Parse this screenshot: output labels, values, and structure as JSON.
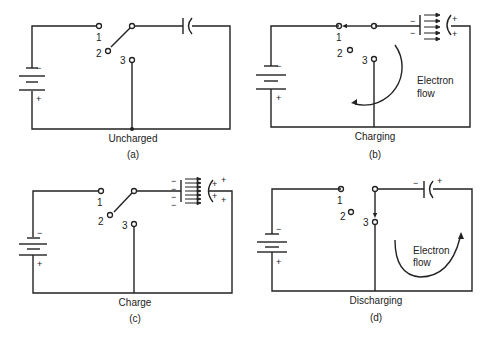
{
  "figure": {
    "panels": [
      {
        "id": "a",
        "state_label": "Uncharged",
        "panel_label": "(a)",
        "switch_position": "2",
        "flow_label": ""
      },
      {
        "id": "b",
        "state_label": "Charging",
        "panel_label": "(b)",
        "switch_position": "1",
        "flow_label_line1": "Electron",
        "flow_label_line2": "flow"
      },
      {
        "id": "c",
        "state_label": "Charge",
        "panel_label": "(c)",
        "switch_position": "2",
        "flow_label": ""
      },
      {
        "id": "d",
        "state_label": "Discharging",
        "panel_label": "(d)",
        "switch_position": "3",
        "flow_label_line1": "Electron",
        "flow_label_line2": "flow"
      }
    ],
    "terminals": {
      "t1": "1",
      "t2": "2",
      "t3": "3"
    },
    "battery": {
      "neg": "−",
      "pos": "+"
    },
    "capacitor_signs": {
      "neg": "−",
      "pos": "+"
    }
  }
}
